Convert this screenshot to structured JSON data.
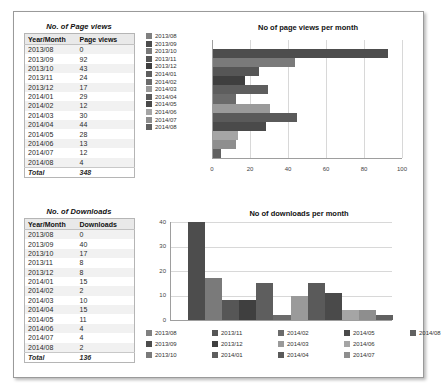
{
  "page_views_table": {
    "title": "No. of Page views",
    "columns": [
      "Year/Month",
      "Page views"
    ],
    "rows": [
      {
        "month": "2013/08",
        "value": "0"
      },
      {
        "month": "2013/09",
        "value": "92"
      },
      {
        "month": "2013/10",
        "value": "43"
      },
      {
        "month": "2013/11",
        "value": "24"
      },
      {
        "month": "2013/12",
        "value": "17"
      },
      {
        "month": "2014/01",
        "value": "29"
      },
      {
        "month": "2014/02",
        "value": "12"
      },
      {
        "month": "2014/03",
        "value": "30"
      },
      {
        "month": "2014/04",
        "value": "44"
      },
      {
        "month": "2014/05",
        "value": "28"
      },
      {
        "month": "2014/06",
        "value": "13"
      },
      {
        "month": "2014/07",
        "value": "12"
      },
      {
        "month": "2014/08",
        "value": "4"
      }
    ],
    "total_label": "Total",
    "total_value": "348"
  },
  "downloads_table": {
    "title": "No. of Downloads",
    "columns": [
      "Year/Month",
      "Downloads"
    ],
    "rows": [
      {
        "month": "2013/08",
        "value": "0"
      },
      {
        "month": "2013/09",
        "value": "40"
      },
      {
        "month": "2013/10",
        "value": "17"
      },
      {
        "month": "2013/11",
        "value": "8"
      },
      {
        "month": "2013/12",
        "value": "8"
      },
      {
        "month": "2014/01",
        "value": "15"
      },
      {
        "month": "2014/02",
        "value": "2"
      },
      {
        "month": "2014/03",
        "value": "10"
      },
      {
        "month": "2014/04",
        "value": "15"
      },
      {
        "month": "2014/05",
        "value": "11"
      },
      {
        "month": "2014/06",
        "value": "4"
      },
      {
        "month": "2014/07",
        "value": "4"
      },
      {
        "month": "2014/08",
        "value": "2"
      }
    ],
    "total_label": "Total",
    "total_value": "136"
  },
  "chart_data": [
    {
      "type": "bar",
      "orientation": "horizontal",
      "title": "No of page views per month",
      "categories": [
        "2013/08",
        "2013/09",
        "2013/10",
        "2013/11",
        "2013/12",
        "2014/01",
        "2014/02",
        "2014/03",
        "2014/04",
        "2014/05",
        "2014/06",
        "2014/07",
        "2014/08"
      ],
      "values": [
        0,
        92,
        43,
        24,
        17,
        29,
        12,
        30,
        44,
        28,
        13,
        12,
        4
      ],
      "colors": [
        "#808080",
        "#4d4d4d",
        "#7a7a7a",
        "#565656",
        "#3f3f3f",
        "#5e5e5e",
        "#6b6b6b",
        "#9a9a9a",
        "#5a5a5a",
        "#4a4a4a",
        "#a5a5a5",
        "#8e8e8e",
        "#616161"
      ],
      "xlabel": "",
      "ylabel": "",
      "xlim": [
        0,
        100
      ],
      "xticks": [
        "0",
        "20",
        "40",
        "60",
        "80",
        "100"
      ],
      "grid": true,
      "legend_position": "left",
      "legend": [
        "2013/08",
        "2013/09",
        "2013/10",
        "2013/11",
        "2013/12",
        "2014/01",
        "2014/02",
        "2014/03",
        "2014/04",
        "2014/05",
        "2014/06",
        "2014/07",
        "2014/08"
      ]
    },
    {
      "type": "bar",
      "orientation": "vertical",
      "title": "No of downloads per month",
      "categories": [
        "2013/08",
        "2013/09",
        "2013/10",
        "2013/11",
        "2013/12",
        "2014/01",
        "2014/02",
        "2014/03",
        "2014/04",
        "2014/05",
        "2014/06",
        "2014/07",
        "2014/08"
      ],
      "values": [
        0,
        40,
        17,
        8,
        8,
        15,
        2,
        10,
        15,
        11,
        4,
        4,
        2
      ],
      "colors": [
        "#808080",
        "#4d4d4d",
        "#7a7a7a",
        "#565656",
        "#3f3f3f",
        "#5e5e5e",
        "#6b6b6b",
        "#9a9a9a",
        "#5a5a5a",
        "#4a4a4a",
        "#a5a5a5",
        "#8e8e8e",
        "#616161"
      ],
      "xlabel": "",
      "ylabel": "",
      "ylim": [
        0,
        40
      ],
      "yticks": [
        "0",
        "10",
        "20",
        "30",
        "40"
      ],
      "grid": true,
      "legend_position": "bottom",
      "legend": [
        "2013/08",
        "2013/09",
        "2013/10",
        "2013/11",
        "2013/12",
        "2014/01",
        "2014/02",
        "2014/03",
        "2014/04",
        "2014/05",
        "2014/06",
        "2014/07",
        "2014/08"
      ]
    }
  ]
}
